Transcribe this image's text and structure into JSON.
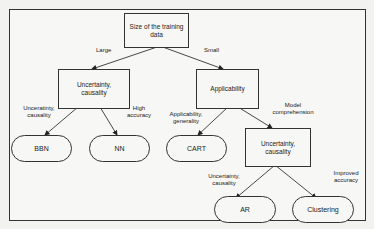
{
  "nodes": {
    "root": "Size of the training data",
    "left": "Uncertainty, causality",
    "right": "Applicability",
    "right_child": "Uncertainty, causality",
    "bbn": "BBN",
    "nn": "NN",
    "cart": "CART",
    "ar": "AR",
    "clustering": "Clustering"
  },
  "edges": {
    "large": "Large",
    "small": "Small",
    "to_bbn": "Unceratinty, causality",
    "to_nn": "High accuracy",
    "to_cart": "Applicability, generality",
    "to_right_child": "Model comprehension",
    "to_ar": "Uncertainty, causality",
    "to_clustering": "Improved accuracy"
  }
}
